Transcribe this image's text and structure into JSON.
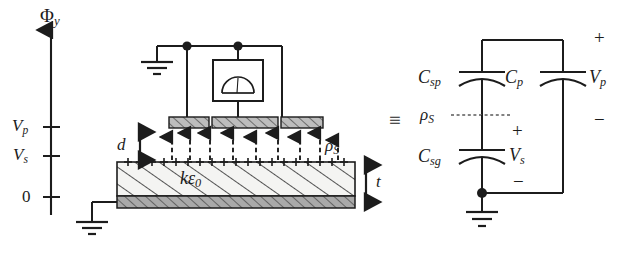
{
  "figure": {
    "equivalence_symbol": "≡"
  },
  "axis": {
    "name": "potential-axis",
    "label": "Φ",
    "label_subscript": "y",
    "ticks": [
      {
        "label": "V",
        "subscript": "p",
        "value_position": "upper"
      },
      {
        "label": "V",
        "subscript": "s",
        "value_position": "middle"
      },
      {
        "label": "0",
        "subscript": "",
        "value_position": "zero"
      }
    ]
  },
  "physical": {
    "gap_label": "d",
    "thickness_label": "t",
    "permittivity_label": "kε",
    "permittivity_subscript": "0",
    "surface_charge_label": "ρ",
    "surface_charge_subscript": "S",
    "plate_count": 3,
    "field_arrow_count": 9,
    "plus_charge_count": 20,
    "meter_name": "voltmeter",
    "ground_count": 2
  },
  "circuit": {
    "components": [
      {
        "name": "capacitor-csp",
        "label": "C",
        "subscript": "sp"
      },
      {
        "name": "capacitor-csg",
        "label": "C",
        "subscript": "sg"
      },
      {
        "name": "capacitor-cp",
        "label": "C",
        "subscript": "p"
      }
    ],
    "charge_node_label": "ρ",
    "charge_node_subscript": "S",
    "voltages": [
      {
        "name": "voltage-vp",
        "label": "V",
        "subscript": "p",
        "plus": "+",
        "minus": "−"
      },
      {
        "name": "voltage-vs",
        "label": "V",
        "subscript": "s",
        "plus": "+",
        "minus": "−"
      }
    ],
    "ground_count": 1
  },
  "colors": {
    "ink": "#1c1c1c",
    "slab_fill": "#f2f2f0",
    "electrode_fill": "#b8b8b8",
    "base_fill": "#9a9a9a",
    "dash": "#1c1c1c"
  }
}
